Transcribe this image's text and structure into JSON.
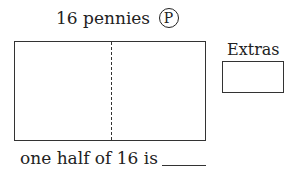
{
  "title": {
    "text": "16 pennies",
    "coin_symbol": "P",
    "coin_icon": "penny-circle-icon"
  },
  "main_box": {
    "divider": "dashed-vertical-center",
    "parts": 2
  },
  "extras": {
    "label": "Extras"
  },
  "question": {
    "text": "one half of 16 is",
    "answer": ""
  }
}
